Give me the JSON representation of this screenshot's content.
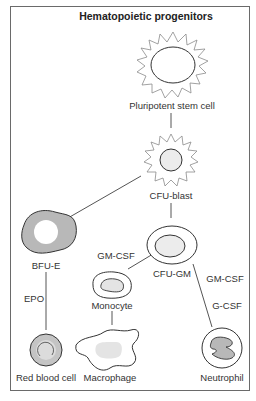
{
  "title": "Hematopoietic progenitors",
  "cells": {
    "stem": "Pluripotent stem cell",
    "blast": "CFU-blast",
    "bfue": "BFU-E",
    "cfugm": "CFU-GM",
    "monocyte": "Monocyte",
    "rbc": "Red blood cell",
    "macrophage": "Macrophage",
    "neutrophil": "Neutrophil"
  },
  "factors": {
    "epo": "EPO",
    "gmcsf_left": "GM-CSF",
    "gmcsf_right": "GM-CSF",
    "gcsf": "G-CSF"
  },
  "colors": {
    "line": "#555555",
    "cell_fill_grey": "#b8b8b8",
    "nucleus_light": "#e6e6e6",
    "spiky_stroke": "#8a8a8a"
  }
}
